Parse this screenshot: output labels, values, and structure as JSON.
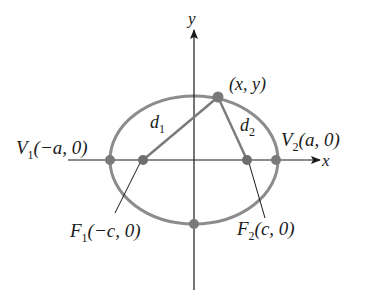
{
  "figure": {
    "colors": {
      "curve": "#8c8c8c",
      "points": "#7a7a7a",
      "axes": "#1a1a1a",
      "segments": "#7a7a7a",
      "text": "#1a1a1a"
    },
    "axes": {
      "x_label": "x",
      "y_label": "y"
    },
    "point": {
      "label": "(x, y)"
    },
    "distances": {
      "d1": {
        "base": "d",
        "sub": "1"
      },
      "d2": {
        "base": "d",
        "sub": "2"
      }
    },
    "vertices": {
      "V1": {
        "name": "V",
        "sub": "1",
        "coords": "(−a, 0)"
      },
      "V2": {
        "name": "V",
        "sub": "2",
        "coords": "(a, 0)"
      }
    },
    "foci": {
      "F1": {
        "name": "F",
        "sub": "1",
        "coords": "(−c, 0)"
      },
      "F2": {
        "name": "F",
        "sub": "2",
        "coords": "(c, 0)"
      }
    }
  }
}
